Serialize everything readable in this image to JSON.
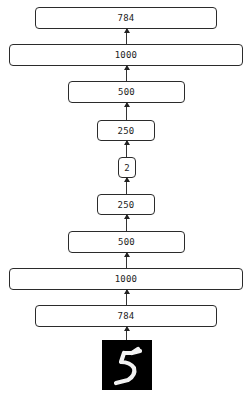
{
  "diagram": {
    "type": "autoencoder",
    "direction": "bottom-to-top",
    "input_image": {
      "label": "handwritten digit",
      "digit": "5"
    },
    "layers": [
      {
        "id": "enc_784",
        "units": "784"
      },
      {
        "id": "enc_1000",
        "units": "1000"
      },
      {
        "id": "enc_500",
        "units": "500"
      },
      {
        "id": "enc_250",
        "units": "250"
      },
      {
        "id": "code_2",
        "units": "2"
      },
      {
        "id": "dec_250",
        "units": "250"
      },
      {
        "id": "dec_500",
        "units": "500"
      },
      {
        "id": "dec_1000",
        "units": "1000"
      },
      {
        "id": "dec_784",
        "units": "784"
      }
    ]
  }
}
